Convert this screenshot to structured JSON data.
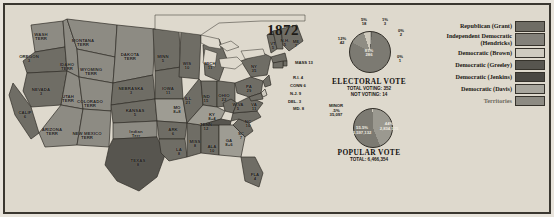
{
  "title": "1872",
  "map": {
    "name": "united-states-electoral-map-1872",
    "states": [
      {
        "abbr": "WASH\nTERR",
        "votes": "",
        "x": 36,
        "y": 28,
        "type": "territory"
      },
      {
        "abbr": "OREGON",
        "votes": "3",
        "x": 24,
        "y": 50,
        "type": "republican"
      },
      {
        "abbr": "IDAHO\nTERR",
        "votes": "",
        "x": 62,
        "y": 58,
        "type": "territory"
      },
      {
        "abbr": "MONTANA\nTERR",
        "votes": "",
        "x": 78,
        "y": 34,
        "type": "territory"
      },
      {
        "abbr": "WYOMING\nTERR",
        "votes": "",
        "x": 86,
        "y": 63,
        "type": "territory"
      },
      {
        "abbr": "DAKOTA\nTERR",
        "votes": "",
        "x": 125,
        "y": 48,
        "type": "territory"
      },
      {
        "abbr": "NEVADA",
        "votes": "3",
        "x": 36,
        "y": 83,
        "type": "republican"
      },
      {
        "abbr": "UTAH\nTERR",
        "votes": "",
        "x": 63,
        "y": 90,
        "type": "territory"
      },
      {
        "abbr": "COLORADO\nTERR",
        "votes": "",
        "x": 85,
        "y": 95,
        "type": "territory"
      },
      {
        "abbr": "CALIF",
        "votes": "6",
        "x": 20,
        "y": 106,
        "type": "republican"
      },
      {
        "abbr": "NEBRASKA",
        "votes": "3",
        "x": 126,
        "y": 82,
        "type": "republican"
      },
      {
        "abbr": "KANSAS",
        "votes": "5",
        "x": 130,
        "y": 104,
        "type": "republican"
      },
      {
        "abbr": "ARIZONA\nTERR",
        "votes": "",
        "x": 47,
        "y": 123,
        "type": "territory"
      },
      {
        "abbr": "NEW MEXICO\nTERR",
        "votes": "",
        "x": 82,
        "y": 127,
        "type": "territory"
      },
      {
        "abbr": "Indian\nTerr",
        "votes": "",
        "x": 131,
        "y": 125,
        "type": "territory"
      },
      {
        "abbr": "TEXAS",
        "votes": "8",
        "x": 133,
        "y": 154,
        "type": "democratic-greeley"
      },
      {
        "abbr": "MINN",
        "votes": "5",
        "x": 158,
        "y": 50,
        "type": "republican"
      },
      {
        "abbr": "IOWA",
        "votes": "11",
        "x": 163,
        "y": 82,
        "type": "republican"
      },
      {
        "abbr": "MO",
        "votes": "8+8",
        "x": 172,
        "y": 101,
        "type": "split"
      },
      {
        "abbr": "ARK",
        "votes": "6",
        "x": 168,
        "y": 123,
        "type": "republican"
      },
      {
        "abbr": "LA",
        "votes": "8",
        "x": 174,
        "y": 143,
        "type": "republican"
      },
      {
        "abbr": "MISS",
        "votes": "8",
        "x": 190,
        "y": 135,
        "type": "republican"
      },
      {
        "abbr": "ALA",
        "votes": "10",
        "x": 207,
        "y": 140,
        "type": "republican"
      },
      {
        "abbr": "WIS",
        "votes": "10",
        "x": 182,
        "y": 57,
        "type": "republican"
      },
      {
        "abbr": "MICH",
        "votes": "11",
        "x": 205,
        "y": 57,
        "type": "republican"
      },
      {
        "abbr": "ILL",
        "votes": "21",
        "x": 183,
        "y": 92,
        "type": "republican"
      },
      {
        "abbr": "IND",
        "votes": "15",
        "x": 201,
        "y": 90,
        "type": "republican"
      },
      {
        "abbr": "OHIO",
        "votes": "22",
        "x": 219,
        "y": 89,
        "type": "republican"
      },
      {
        "abbr": "KY",
        "votes": "8+4",
        "x": 207,
        "y": 108,
        "type": "split"
      },
      {
        "abbr": "TENN",
        "votes": "12",
        "x": 201,
        "y": 118,
        "type": "democratic-greeley"
      },
      {
        "abbr": "GA",
        "votes": "8+6",
        "x": 224,
        "y": 134,
        "type": "split"
      },
      {
        "abbr": "FLA",
        "votes": "4",
        "x": 250,
        "y": 168,
        "type": "republican"
      },
      {
        "abbr": "SC",
        "votes": "7",
        "x": 236,
        "y": 127,
        "type": "republican"
      },
      {
        "abbr": "NC",
        "votes": "10",
        "x": 243,
        "y": 115,
        "type": "republican"
      },
      {
        "abbr": "W.VA",
        "votes": "5",
        "x": 233,
        "y": 98,
        "type": "republican"
      },
      {
        "abbr": "VA",
        "votes": "11",
        "x": 249,
        "y": 98,
        "type": "republican"
      },
      {
        "abbr": "PA",
        "votes": "29",
        "x": 244,
        "y": 80,
        "type": "republican"
      },
      {
        "abbr": "NY",
        "votes": "35",
        "x": 249,
        "y": 60,
        "type": "republican"
      },
      {
        "abbr": "VT",
        "votes": "5",
        "x": 268,
        "y": 37,
        "type": "republican"
      },
      {
        "abbr": "N.H.",
        "votes": "5",
        "x": 280,
        "y": 34,
        "type": "republican"
      },
      {
        "abbr": "ME",
        "votes": "7",
        "x": 291,
        "y": 35,
        "type": "republican"
      }
    ],
    "callouts": [
      {
        "label": "MASS",
        "votes": "13",
        "x": 290,
        "y": 55
      },
      {
        "label": "R.I.",
        "votes": "4",
        "x": 288,
        "y": 70
      },
      {
        "label": "CONN",
        "votes": "6",
        "x": 285,
        "y": 78
      },
      {
        "label": "N.J.",
        "votes": "9",
        "x": 285,
        "y": 86
      },
      {
        "label": "DEL.",
        "votes": "3",
        "x": 283,
        "y": 94
      },
      {
        "label": "MD.",
        "votes": "8",
        "x": 288,
        "y": 101
      }
    ]
  },
  "electoral_chart": {
    "type": "pie",
    "title": "ELECTORAL  VOTE",
    "subtitle_1": "TOTAL VOTING: 352",
    "subtitle_2": "NOT VOTING: 14",
    "slices": [
      {
        "label": "81%",
        "value": "286",
        "pct": 81,
        "color": "#7c7a72"
      },
      {
        "label": "12%",
        "value": "42",
        "pct": 12,
        "color": "#8f8d84"
      },
      {
        "label": "5%",
        "value": "18",
        "pct": 5,
        "color": "#cfcabd"
      },
      {
        "label": "1%",
        "value": "3",
        "pct": 1,
        "color": "#a9a79e"
      },
      {
        "label": "0%",
        "value": "2",
        "pct": 0.6,
        "color": "#5d5b55"
      },
      {
        "label": "0%",
        "value": "1",
        "pct": 0.3,
        "color": "#6e6c65"
      }
    ]
  },
  "popular_chart": {
    "type": "pie",
    "title": "POPULAR  VOTE",
    "subtitle_1": "TOTAL: 6,466,354",
    "slices": [
      {
        "label": "55.5%",
        "value": "3,597,132",
        "pct": 55.5,
        "color": "#7c7a72"
      },
      {
        "label": "44%",
        "value": "2,834,125",
        "pct": 44,
        "color": "#9b9990"
      },
      {
        "label": "MINOR\n.5%",
        "value": "35,097",
        "pct": 0.5,
        "color": "#cfcabd"
      }
    ]
  },
  "legend": {
    "name": "party-legend",
    "items": [
      {
        "label": "Republican (Grant)",
        "color": "#6f6d65",
        "territory": false
      },
      {
        "label": "Independent Democratic\n(Hendricks)",
        "color": "#83817a",
        "territory": false
      },
      {
        "label": "Democratic (Brown)",
        "color": "#cfcbc0",
        "territory": false
      },
      {
        "label": "Democratic (Greeley)",
        "color": "#57554f",
        "territory": false
      },
      {
        "label": "Democratic (Jenkins)",
        "color": "#4a4843",
        "territory": false
      },
      {
        "label": "Democratic (Davis)",
        "color": "#a8a69d",
        "territory": false
      },
      {
        "label": "Territories",
        "color": "#8d8b83",
        "territory": true
      }
    ]
  }
}
